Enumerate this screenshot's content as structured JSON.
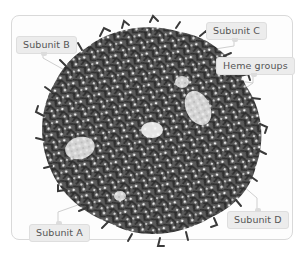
{
  "figure": {
    "colors": {
      "frame_border": "#d9d9d9",
      "protein_sticks": "#3a3a3a",
      "heme_groups": "#d6d6d6",
      "label_bg": "#ececec",
      "label_text": "#555555",
      "leader_line": "#cfcfcf"
    },
    "labels": {
      "subunit_a": "Subunit A",
      "subunit_b": "Subunit B",
      "subunit_c": "Subunit C",
      "subunit_d": "Subunit D",
      "heme_groups": "Heme groups"
    }
  }
}
